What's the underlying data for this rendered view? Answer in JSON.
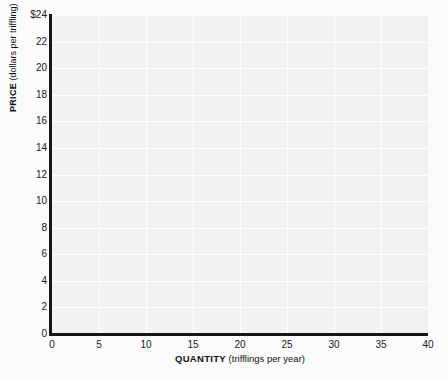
{
  "chart_data": {
    "type": "line",
    "title": "",
    "subtitle": "",
    "xlabel_bold": "QUANTITY",
    "xlabel_unit": "(trifflings per year)",
    "ylabel_bold": "PRICE",
    "ylabel_unit": "(dollars per triffling)",
    "xlim": [
      0,
      40
    ],
    "ylim": [
      0,
      24
    ],
    "xticks": [
      0,
      5,
      10,
      15,
      20,
      25,
      30,
      35,
      40
    ],
    "xtick_labels": [
      "0",
      "5",
      "10",
      "15",
      "20",
      "25",
      "30",
      "35",
      "40"
    ],
    "yticks": [
      0,
      2,
      4,
      6,
      8,
      10,
      12,
      14,
      16,
      18,
      20,
      22,
      24
    ],
    "ytick_labels": [
      "0",
      "2",
      "4",
      "6",
      "8",
      "10",
      "12",
      "14",
      "16",
      "18",
      "20",
      "22",
      "$24"
    ],
    "grid": true,
    "grid_color": "#ffffff",
    "plot_background": "#f2f2f2",
    "axis_color": "#161616",
    "legend": null,
    "series": [],
    "annotations": [],
    "note": "Empty grid — no data plotted"
  },
  "header": {
    "remnant_text": ""
  }
}
